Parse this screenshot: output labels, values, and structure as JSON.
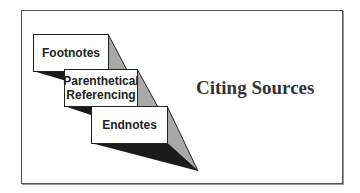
{
  "title": "Citing Sources",
  "boxes": [
    {
      "label": "Footnotes"
    },
    {
      "label_line1": "Parenthetical",
      "label_line2": "Referencing"
    },
    {
      "label": "Endnotes"
    }
  ],
  "colors": {
    "shadow_light": "#a8a8a8",
    "shadow_dark": "#1a1a1a",
    "border": "#222222"
  }
}
